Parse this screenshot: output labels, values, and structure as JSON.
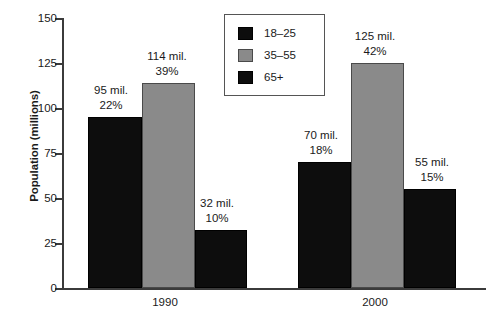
{
  "chart_data": {
    "type": "bar",
    "title": "",
    "xlabel": "",
    "ylabel": "Population (millions)",
    "categories": [
      "1990",
      "2000"
    ],
    "ylim": [
      0,
      150
    ],
    "yticks": [
      0,
      25,
      50,
      75,
      100,
      125,
      150
    ],
    "ytick_labels": [
      "0",
      "25",
      "50",
      "75",
      "100",
      "125",
      "150"
    ],
    "grid": false,
    "legend_position": "top-center",
    "series": [
      {
        "name": "18–25",
        "color": "#0d0d0d",
        "values": [
          95,
          70
        ],
        "percents": [
          "22%",
          "18%"
        ],
        "value_labels": [
          "95 mil.",
          "70 mil."
        ]
      },
      {
        "name": "35–55",
        "color": "#8a8a8a",
        "values": [
          114,
          125
        ],
        "percents": [
          "39%",
          "42%"
        ],
        "value_labels": [
          "114 mil.",
          "125 mil."
        ]
      },
      {
        "name": "65+",
        "color": "#0d0d0d",
        "values": [
          32,
          55
        ],
        "percents": [
          "10%",
          "15%"
        ],
        "value_labels": [
          "32 mil.",
          "55 mil."
        ]
      }
    ],
    "bars": [
      {
        "group": "1990",
        "series": "18–25",
        "value": 95,
        "amount_label": "95 mil.",
        "percent_label": "22%",
        "color": "#0d0d0d"
      },
      {
        "group": "1990",
        "series": "35–55",
        "value": 114,
        "amount_label": "114 mil.",
        "percent_label": "39%",
        "color": "#8a8a8a"
      },
      {
        "group": "1990",
        "series": "65+",
        "value": 32,
        "amount_label": "32 mil.",
        "percent_label": "10%",
        "color": "#0d0d0d"
      },
      {
        "group": "2000",
        "series": "18–25",
        "value": 70,
        "amount_label": "70 mil.",
        "percent_label": "18%",
        "color": "#0d0d0d"
      },
      {
        "group": "2000",
        "series": "35–55",
        "value": 125,
        "amount_label": "125 mil.",
        "percent_label": "42%",
        "color": "#8a8a8a"
      },
      {
        "group": "2000",
        "series": "65+",
        "value": 55,
        "amount_label": "55 mil.",
        "percent_label": "15%",
        "color": "#0d0d0d"
      }
    ]
  },
  "axis": {
    "y_title": "Population (millions)",
    "y_tick_labels": [
      "150",
      "125",
      "100",
      "75",
      "50",
      "25",
      "0"
    ],
    "x_tick_labels": [
      "1990",
      "2000"
    ]
  },
  "legend": {
    "items": [
      {
        "label": "18–25",
        "swatch": "dark"
      },
      {
        "label": "35–55",
        "swatch": "gray"
      },
      {
        "label": "65+",
        "swatch": "dark"
      }
    ]
  },
  "colors": {
    "dark_bar": "#0d0d0d",
    "gray_bar": "#8a8a8a",
    "axis": "#3b3b3b",
    "background": "#ffffff",
    "text": "#1a1a1a"
  }
}
